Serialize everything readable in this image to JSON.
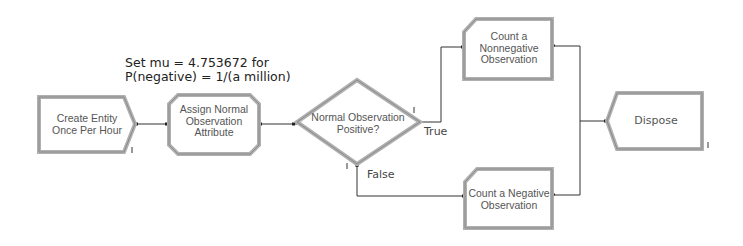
{
  "annotation": {
    "line1": "Set mu = 4.753672 for",
    "line2": "P(negative) = 1/(a million)"
  },
  "modules": {
    "create": {
      "type": "Create",
      "line1": "Create Entity",
      "line2": "Once Per Hour"
    },
    "assign": {
      "type": "Assign",
      "line1": "Assign Normal",
      "line2": "Observation",
      "line3": "Attribute"
    },
    "decide": {
      "type": "Decide",
      "line1": "Normal Observation",
      "line2": "Positive?"
    },
    "record_nonneg": {
      "type": "Record",
      "line1": "Count a",
      "line2": "Nonnegative",
      "line3": "Observation"
    },
    "record_neg": {
      "type": "Record",
      "line1": "Count a Negative",
      "line2": "Observation"
    },
    "dispose": {
      "type": "Dispose",
      "line1": "Dispose"
    }
  },
  "branches": {
    "true_label": "True",
    "false_label": "False"
  },
  "colors": {
    "module_border": "#a8a8a8",
    "module_border_dark": "#8c8c8c",
    "connector": "#333333",
    "text": "#555555"
  }
}
